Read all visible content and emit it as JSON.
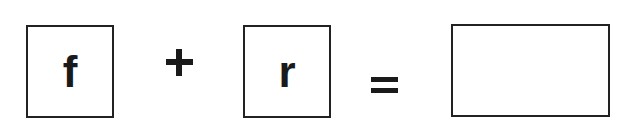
{
  "equation": {
    "operand1": {
      "letter": "f"
    },
    "operator1": {
      "symbol": "+",
      "icon": "plus-icon"
    },
    "operand2": {
      "letter": "r"
    },
    "operator2": {
      "symbol": "=",
      "icon": "equals-icon"
    },
    "result": {
      "value": ""
    }
  },
  "colors": {
    "stroke": "#222222",
    "text": "#1a1a1a",
    "background": "#ffffff"
  }
}
